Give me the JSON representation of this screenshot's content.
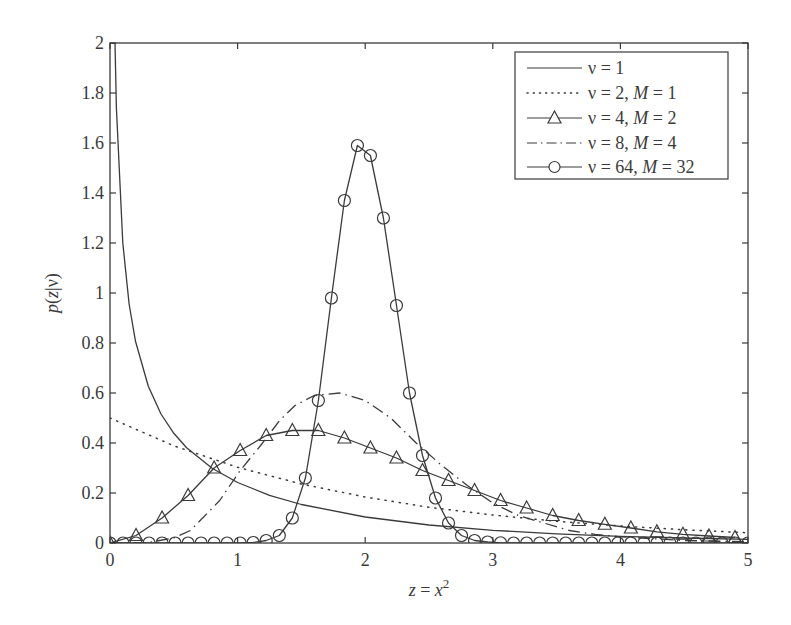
{
  "chart_data": {
    "type": "line",
    "title": "",
    "xlabel": "z = x²",
    "ylabel": "p(z|ν)",
    "xlim": [
      0,
      5
    ],
    "ylim": [
      0,
      2
    ],
    "xticks": [
      "0",
      "1",
      "2",
      "3",
      "4",
      "5"
    ],
    "yticks": [
      "0",
      "0.2",
      "0.4",
      "0.6",
      "0.8",
      "1",
      "1.2",
      "1.4",
      "1.6",
      "1.8",
      "2"
    ],
    "grid": false,
    "legend_position": "upper right",
    "series": [
      {
        "name": "ν = 1",
        "style": "solid",
        "marker": "none",
        "x": [
          0.039,
          0.05,
          0.1,
          0.15,
          0.2,
          0.3,
          0.4,
          0.5,
          0.6,
          0.8,
          1.0,
          1.25,
          1.5,
          2.0,
          2.5,
          3.0,
          3.5,
          4.0,
          4.5,
          5.0
        ],
        "y": [
          2.0,
          1.74,
          1.2,
          0.956,
          0.807,
          0.627,
          0.516,
          0.439,
          0.381,
          0.299,
          0.242,
          0.191,
          0.154,
          0.104,
          0.072,
          0.051,
          0.037,
          0.027,
          0.02,
          0.015
        ]
      },
      {
        "name": "ν = 2, M = 1",
        "style": "dotted",
        "marker": "none",
        "x": [
          0,
          0.5,
          1.0,
          1.5,
          2.0,
          2.5,
          3.0,
          3.5,
          4.0,
          4.5,
          5.0
        ],
        "y": [
          0.5,
          0.389,
          0.303,
          0.236,
          0.184,
          0.143,
          0.112,
          0.087,
          0.068,
          0.053,
          0.041
        ]
      },
      {
        "name": "ν = 4, M = 2",
        "style": "solid",
        "marker": "triangle",
        "x": [
          0,
          0.204,
          0.408,
          0.612,
          0.816,
          1.02,
          1.224,
          1.429,
          1.633,
          1.837,
          2.041,
          2.245,
          2.449,
          2.653,
          2.857,
          3.061,
          3.265,
          3.469,
          3.673,
          3.878,
          4.082,
          4.286,
          4.49,
          4.694,
          4.898
        ],
        "y": [
          0.0,
          0.03,
          0.1,
          0.19,
          0.3,
          0.37,
          0.43,
          0.45,
          0.45,
          0.42,
          0.38,
          0.34,
          0.29,
          0.25,
          0.21,
          0.17,
          0.14,
          0.11,
          0.09,
          0.075,
          0.06,
          0.045,
          0.035,
          0.028,
          0.022
        ]
      },
      {
        "name": "ν = 8, M = 4",
        "style": "dashdot",
        "marker": "none",
        "x": [
          0,
          0.3,
          0.5,
          0.63,
          0.86,
          1.02,
          1.18,
          1.33,
          1.45,
          1.6,
          1.8,
          2.0,
          2.2,
          2.4,
          2.6,
          2.8,
          3.0,
          3.2,
          3.4,
          3.6,
          3.8,
          4.0,
          4.5,
          5.0
        ],
        "y": [
          0,
          0.002,
          0.02,
          0.05,
          0.17,
          0.29,
          0.39,
          0.49,
          0.55,
          0.59,
          0.6,
          0.57,
          0.5,
          0.4,
          0.31,
          0.23,
          0.16,
          0.11,
          0.08,
          0.05,
          0.035,
          0.025,
          0.01,
          0.005
        ]
      },
      {
        "name": "ν = 64, M = 32",
        "style": "solid",
        "marker": "circle",
        "x": [
          0,
          0.102,
          0.204,
          0.306,
          0.408,
          0.51,
          0.612,
          0.714,
          0.816,
          0.918,
          1.02,
          1.122,
          1.224,
          1.327,
          1.429,
          1.531,
          1.633,
          1.735,
          1.837,
          1.939,
          2.041,
          2.143,
          2.245,
          2.347,
          2.449,
          2.551,
          2.653,
          2.755,
          2.857,
          2.959,
          3.061,
          3.163,
          3.265,
          3.367,
          3.469,
          3.571,
          3.673,
          3.776,
          3.878,
          3.98,
          4.082,
          4.184,
          4.286,
          4.388,
          4.49,
          4.592,
          4.694,
          4.796,
          4.898,
          5.0
        ],
        "y": [
          0,
          0,
          0,
          0,
          0,
          0,
          0,
          0,
          0,
          0,
          0,
          0.002,
          0.01,
          0.03,
          0.1,
          0.26,
          0.57,
          0.98,
          1.37,
          1.59,
          1.55,
          1.3,
          0.95,
          0.6,
          0.35,
          0.18,
          0.08,
          0.03,
          0.01,
          0.004,
          0.001,
          0,
          0,
          0,
          0,
          0,
          0,
          0,
          0,
          0,
          0,
          0,
          0,
          0,
          0,
          0,
          0,
          0,
          0,
          0
        ]
      }
    ]
  },
  "legend": {
    "entries": [
      {
        "prefix": "ν = 1",
        "m_label": "",
        "m_value": ""
      },
      {
        "prefix": "ν = 2, ",
        "m_label": "M",
        "m_value": " = 1"
      },
      {
        "prefix": "ν = 4, ",
        "m_label": "M",
        "m_value": " = 2"
      },
      {
        "prefix": "ν = 8, ",
        "m_label": "M",
        "m_value": " = 4"
      },
      {
        "prefix": "ν = 64, ",
        "m_label": "M",
        "m_value": " = 32"
      }
    ]
  },
  "labels": {
    "xlabel_var": "z",
    "xlabel_eq": " = ",
    "xlabel_x": "x",
    "xlabel_exp": "2",
    "ylabel_p": "p",
    "ylabel_open": "(",
    "ylabel_z": "z",
    "ylabel_rest": "|ν)"
  },
  "colors": {
    "line": "#3a3a3a",
    "axis": "#3a3a3a",
    "background": "#ffffff"
  }
}
